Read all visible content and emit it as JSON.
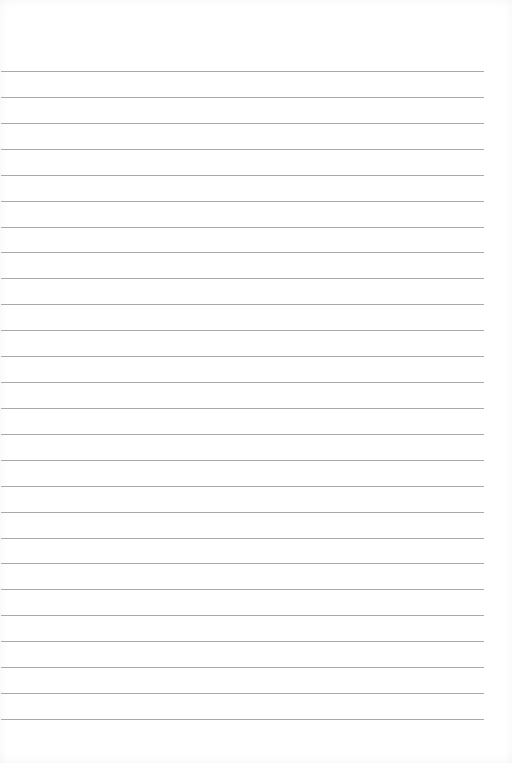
{
  "page": {
    "type": "lined-paper",
    "line_count": 26,
    "first_line_y": 71,
    "line_spacing": 25.92,
    "line_color": "#a9a9a9",
    "background": "#ffffff"
  }
}
